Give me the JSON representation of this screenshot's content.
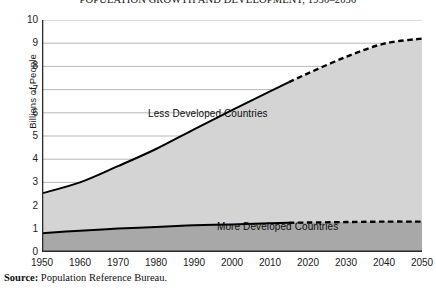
{
  "chart_data": {
    "type": "area",
    "title": "POPULATION GROWTH AND DEVELOPMENT, 1950–2050",
    "xlabel": "",
    "ylabel": "Billions of People",
    "stacked": true,
    "grid": true,
    "legend_position": "inline-annotations",
    "xlim": [
      1950,
      2050
    ],
    "ylim": [
      0,
      10
    ],
    "x_tick_labels": [
      "1950",
      "1960",
      "1970",
      "1980",
      "1990",
      "2000",
      "2010",
      "2020",
      "2030",
      "2040",
      "2050"
    ],
    "y_tick_labels": [
      "0",
      "1",
      "2",
      "3",
      "4",
      "5",
      "6",
      "7",
      "8",
      "9",
      "10"
    ],
    "x": [
      1950,
      1960,
      1970,
      1980,
      1990,
      2000,
      2010,
      2015,
      2020,
      2030,
      2040,
      2050
    ],
    "projection_starts_at": 2015,
    "series": [
      {
        "name": "More Developed Countries",
        "annotation": "More Developed Countries",
        "fill_color": "#a8a8a8",
        "line_color": "#000000",
        "values": [
          0.81,
          0.92,
          1.01,
          1.08,
          1.15,
          1.19,
          1.24,
          1.26,
          1.27,
          1.29,
          1.31,
          1.31
        ]
      },
      {
        "name": "Less Developed Countries",
        "annotation": "Less Developed Countries",
        "fill_color": "#d4d4d4",
        "line_color": "#000000",
        "values": [
          1.72,
          2.08,
          2.69,
          3.36,
          4.14,
          4.93,
          5.68,
          6.06,
          6.43,
          7.12,
          7.67,
          7.89
        ]
      }
    ],
    "totals": [
      2.53,
      3.0,
      3.7,
      4.44,
      5.29,
      6.12,
      6.92,
      7.32,
      7.7,
      8.41,
      8.98,
      9.2
    ]
  },
  "source": {
    "label": "Source:",
    "text": " Population Reference Bureau."
  }
}
